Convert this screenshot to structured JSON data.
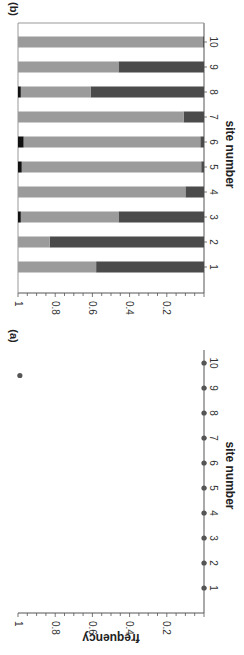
{
  "colors": {
    "light": "#9b9b9b",
    "dark": "#4b4b4b",
    "black": "#111111",
    "axis": "#555555",
    "dot": "#555555"
  },
  "chart_data": [
    {
      "panel": "(a)",
      "type": "scatter",
      "title": "",
      "xlabel": "site number",
      "ylabel": "frequency",
      "categories": [
        "1",
        "2",
        "3",
        "4",
        "5",
        "6",
        "7",
        "8",
        "9",
        "10"
      ],
      "values": [
        0,
        0,
        0,
        0,
        0,
        0,
        0,
        0,
        0,
        0
      ],
      "extra_points": [
        {
          "x": 9.5,
          "y": 0.99
        }
      ],
      "ylim": [
        0,
        1
      ],
      "yticks": [
        "0.2",
        "0.4",
        "0.6",
        "0.8",
        "1"
      ],
      "grid": false,
      "orientation": "rotated 90° clockwise"
    },
    {
      "panel": "(b)",
      "type": "bar",
      "stacked": true,
      "title": "",
      "xlabel": "site number",
      "ylabel": "",
      "categories": [
        "1",
        "2",
        "3",
        "4",
        "5",
        "6",
        "7",
        "8",
        "9",
        "10"
      ],
      "series": [
        {
          "name": "dark",
          "values": [
            0.58,
            0.83,
            0.46,
            0.1,
            0.015,
            0.02,
            0.11,
            0.61,
            0.46,
            0.005
          ]
        },
        {
          "name": "light",
          "values": [
            0.42,
            0.17,
            0.525,
            0.9,
            0.965,
            0.95,
            0.89,
            0.375,
            0.54,
            0.995
          ]
        },
        {
          "name": "black",
          "values": [
            0,
            0,
            0.015,
            0,
            0.02,
            0.03,
            0,
            0.015,
            0,
            0
          ]
        }
      ],
      "ylim": [
        0,
        1
      ],
      "yticks": [
        "0.2",
        "0.4",
        "0.6",
        "0.8",
        "1"
      ],
      "grid": false,
      "orientation": "rotated 90° clockwise"
    }
  ]
}
